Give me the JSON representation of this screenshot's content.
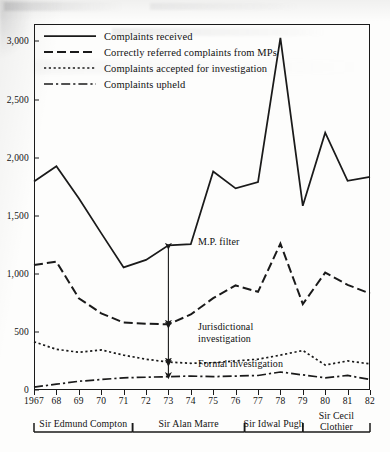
{
  "chart_data": {
    "type": "line",
    "title": "",
    "xlabel": "",
    "ylabel": "",
    "x": [
      1967,
      1968,
      1969,
      1970,
      1971,
      1972,
      1973,
      1974,
      1975,
      1976,
      1977,
      1978,
      1979,
      1980,
      1981,
      1982
    ],
    "xtick_labels": [
      "1967",
      "68",
      "69",
      "70",
      "71",
      "72",
      "73",
      "74",
      "75",
      "76",
      "77",
      "78",
      "79",
      "80",
      "81",
      "82"
    ],
    "ytick_labels": [
      "0",
      "500",
      "1,000",
      "1,500",
      "2,000",
      "2,500",
      "3,000"
    ],
    "ytick_values": [
      0,
      500,
      1000,
      1500,
      2000,
      2500,
      3000
    ],
    "ylim": [
      0,
      3150
    ],
    "xlim": [
      1967,
      1982
    ],
    "grid": false,
    "legend_position": "top-left",
    "series": [
      {
        "name": "Complaints received",
        "style": "solid",
        "values": [
          1795,
          1925,
          1650,
          1350,
          1055,
          1120,
          1245,
          1255,
          1880,
          1735,
          1790,
          3030,
          1585,
          2215,
          1800,
          1835
        ]
      },
      {
        "name": "Correctly referred complaints from MPs",
        "style": "dashed",
        "values": [
          1075,
          1105,
          790,
          660,
          580,
          570,
          565,
          650,
          790,
          900,
          845,
          1260,
          740,
          1010,
          905,
          830
        ]
      },
      {
        "name": "Complaints accepted for investigation",
        "style": "dotted",
        "values": [
          415,
          350,
          325,
          345,
          300,
          265,
          240,
          230,
          235,
          250,
          265,
          300,
          340,
          215,
          250,
          225
        ]
      },
      {
        "name": "Complaints upheld",
        "style": "dashdot",
        "values": [
          25,
          50,
          75,
          90,
          105,
          110,
          115,
          120,
          115,
          120,
          125,
          155,
          130,
          105,
          125,
          90
        ]
      }
    ],
    "annotations": [
      {
        "label": "M.P. filter",
        "from_series": "Correctly referred complaints from MPs",
        "to_series": "Complaints received",
        "at_x": 1973,
        "arrow": "double-headed-vertical"
      },
      {
        "label": "Jurisdictional\ninvestigation",
        "from_series": "Complaints accepted for investigation",
        "to_series": "Correctly referred complaints from MPs",
        "at_x": 1973,
        "arrow": "double-headed-vertical"
      },
      {
        "label": "Formal investigation",
        "from_series": "Complaints upheld",
        "to_series": "Complaints accepted for investigation",
        "at_x": 1973,
        "arrow": "double-headed-vertical"
      }
    ],
    "term_brackets": [
      {
        "label": "Sir Edmund Compton",
        "start_year": 1967,
        "end_year": 1971.4
      },
      {
        "label": "Sir Alan Marre",
        "start_year": 1971.4,
        "end_year": 1976.4
      },
      {
        "label": "Sir Idwal Pugh",
        "start_year": 1976.4,
        "end_year": 1979
      },
      {
        "label": "Sir Cecil\nClothier",
        "label_line1": "Sir Cecil",
        "label_line2": "Clothier",
        "start_year": 1979,
        "end_year": 1982
      }
    ]
  },
  "legend": {
    "items": [
      {
        "label": "Complaints received",
        "style": "solid"
      },
      {
        "label": "Correctly referred complaints from MPs",
        "style": "dashed"
      },
      {
        "label": "Complaints accepted for investigation",
        "style": "dotted"
      },
      {
        "label": "Complaints upheld",
        "style": "dashdot"
      }
    ]
  },
  "colors": {
    "ink": "#1a1a1a",
    "paper": "#fdfdfc"
  }
}
